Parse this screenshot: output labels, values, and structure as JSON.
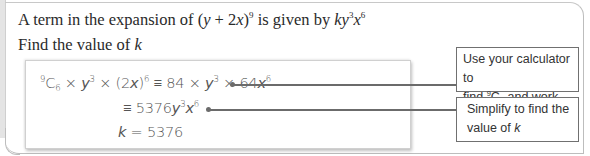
{
  "question": {
    "line1_prefix": "A term in the expansion of (",
    "line1_expr_y": "y",
    "line1_expr_mid": " + 2",
    "line1_expr_x": "x",
    "line1_expr_close": ")",
    "line1_power": "9",
    "line1_given": " is given by ",
    "line1_k": "k",
    "line1_y": "y",
    "line1_ypow": "3",
    "line1_x": "x",
    "line1_xpow": "6",
    "line2_text": "Find the value of ",
    "line2_k": "k"
  },
  "working": {
    "line1": {
      "n": "9",
      "C": "C",
      "r": "6",
      "rest_a": " × ",
      "y": "y",
      "ypow": "3",
      "rest_b": " × (2",
      "x": "x",
      "rest_c": ")",
      "xpow": "6",
      "rest_d": " ≡ 84 × ",
      "y2": "y",
      "y2pow": "3",
      "rest_e": " × 64",
      "x2": "x",
      "x2pow": "6"
    },
    "line2": {
      "prefix": "≡ 5376",
      "y": "y",
      "ypow": "3",
      "x": "x",
      "xpow": "6"
    },
    "line3": {
      "k": "k",
      "rest": " = 5376"
    }
  },
  "callouts": [
    {
      "line1": "Use your calculator to",
      "line2_a": "find ",
      "line2_n": "9",
      "line2_C": "C",
      "line2_r": "6",
      "line2_b": " and work out 2",
      "line2_pow": "6"
    },
    {
      "line1": "Simplify to find the",
      "line2_a": "value of ",
      "line2_k": "k"
    }
  ]
}
